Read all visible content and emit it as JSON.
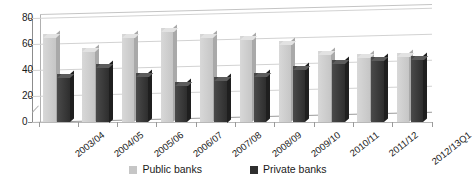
{
  "chart_data": {
    "type": "bar",
    "title": "",
    "xlabel": "",
    "ylabel": "",
    "ylim": [
      0,
      80
    ],
    "yticks": [
      0,
      20,
      40,
      60,
      80
    ],
    "grid": true,
    "legend_position": "bottom",
    "categories": [
      "2003/04",
      "2004/05",
      "2005/06",
      "2006/07",
      "2007/08",
      "2008/09",
      "2009/10",
      "2010/11",
      "2011/12",
      "2012/13Q1"
    ],
    "series": [
      {
        "name": "Public banks",
        "color": "#c6c6c6",
        "values": [
          68,
          57,
          68,
          72,
          68,
          66,
          62,
          55,
          52,
          53
        ]
      },
      {
        "name": "Private banks",
        "color": "#2e2e2e",
        "values": [
          37,
          45,
          38,
          31,
          35,
          38,
          43,
          48,
          50,
          51
        ]
      }
    ]
  },
  "axis": {
    "tick_labels": [
      "0",
      "20",
      "40",
      "60",
      "80"
    ]
  },
  "legend": {
    "items": [
      {
        "label": "Public banks",
        "swatch": "public-banks-swatch"
      },
      {
        "label": "Private banks",
        "swatch": "private-banks-swatch"
      }
    ]
  }
}
